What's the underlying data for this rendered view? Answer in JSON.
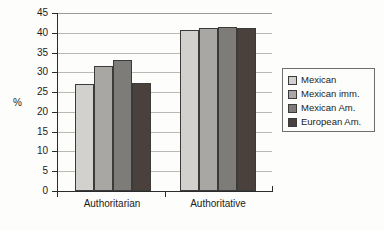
{
  "chart_data": {
    "type": "bar",
    "title": "",
    "subtitle": "",
    "xlabel": "",
    "ylabel": "%",
    "categories": [
      "Authoritarian",
      "Authoritative"
    ],
    "series": [
      {
        "name": "Mexican",
        "color": "#d2d1cd",
        "values": [
          27.0,
          40.7
        ]
      },
      {
        "name": "Mexican imm.",
        "color": "#a9a7a3",
        "values": [
          31.5,
          41.2
        ]
      },
      {
        "name": "Mexican Am.",
        "color": "#7e7c78",
        "values": [
          33.0,
          41.5
        ]
      },
      {
        "name": "European Am.",
        "color": "#4a413d",
        "values": [
          27.4,
          41.2
        ]
      }
    ],
    "ylim": [
      0,
      45
    ],
    "ytick_step": 5,
    "ytick_labels": [
      "0",
      "5",
      "10",
      "15",
      "20",
      "25",
      "30",
      "35",
      "40",
      "45"
    ],
    "grid": "horizontal",
    "legend_position": "right",
    "legend_border": true,
    "background": "#fdfdfb",
    "bar_edge_color": "#3b3b3b",
    "gridline_color": "#b9b9b5",
    "axis_color": "#2b2b2b"
  }
}
